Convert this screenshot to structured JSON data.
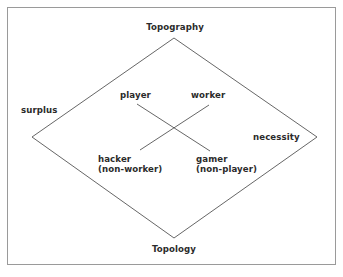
{
  "diagram": {
    "axis_labels": {
      "top": "Topography",
      "bottom": "Topology",
      "left": "surplus",
      "right": "necessity"
    },
    "nodes": {
      "top_left": "player",
      "top_right": "worker",
      "bottom_left": {
        "line1": "hacker",
        "line2": "(non-worker)"
      },
      "bottom_right": {
        "line1": "gamer",
        "line2": "(non-player)"
      }
    },
    "connections": [
      {
        "from": "player",
        "to": "gamer (non-player)"
      },
      {
        "from": "worker",
        "to": "hacker (non-worker)"
      }
    ],
    "colors": {
      "text": "#2b2b2b",
      "lines": "#555555",
      "frame": "#9a9a9a"
    }
  }
}
